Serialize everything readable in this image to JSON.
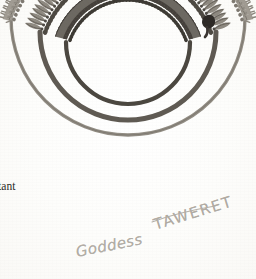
{
  "document": {
    "kind": "scanned-illustration",
    "title": "Taweret amulet necklaces",
    "background_color": "#fdfdfc",
    "ink_color": "#6f6b64",
    "pencil_color": "#b0aba3",
    "printed_text_color": "#2b2a28"
  },
  "printed_caption": {
    "line_stub": "",
    "line_tail": "tant"
  },
  "annotations": [
    {
      "id": "goddess",
      "text": "Goddess",
      "style": "handwritten-pencil-cursive",
      "rotation_deg": -11,
      "x": 76,
      "y": 243
    },
    {
      "id": "taweret",
      "text": "TAWERET",
      "style": "handwritten-pencil-capitals",
      "rotation_deg": -17,
      "x": 154,
      "y": 216,
      "has_overline": true
    }
  ],
  "artwork": {
    "subject": "three concentric beaded necklaces with hanging amulets",
    "view": "open horseshoe / U-shape, opening at top",
    "necklaces": [
      {
        "id": "inner",
        "label": "inner necklace",
        "radius": 62,
        "strand_color": "#4a4640",
        "strand_width": 4.2,
        "bead_count": 46,
        "pendant_shape": "trapezoid-wedge",
        "pendant_length": 13,
        "pendant_color": "#6a6660",
        "tone": "darkest"
      },
      {
        "id": "middle",
        "label": "middle necklace",
        "radius": 88,
        "strand_color": "#5c574f",
        "strand_width": 5.0,
        "bead_count": 52,
        "pendant_shape": "leaf-petal",
        "pendant_length": 19,
        "pendant_color": "#8a857c",
        "tone": "medium-dark",
        "has_clasp_knot": true,
        "clasp_color": "#2e2b27"
      },
      {
        "id": "outer",
        "label": "outer necklace",
        "radius": 117,
        "strand_color": "#8e8980",
        "strand_width": 3.4,
        "bead_count": 60,
        "pendant_shape": "standing-taweret-figure",
        "pendant_length": 17,
        "pendant_color": "#9a958c",
        "tone": "light"
      }
    ],
    "center": {
      "x": 128,
      "y": 62
    }
  }
}
